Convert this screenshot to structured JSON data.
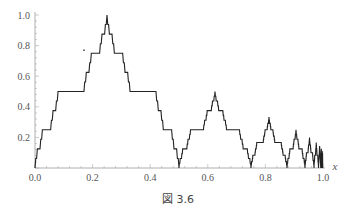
{
  "chart_data": {
    "type": "line",
    "title": "",
    "caption": "図 3.6",
    "xlabel": "x",
    "ylabel": "",
    "xlim": [
      0,
      1
    ],
    "ylim": [
      0,
      1.0
    ],
    "grid": false,
    "legend": null,
    "x_ticks": [
      0.0,
      0.2,
      0.4,
      0.6,
      0.8,
      1.0
    ],
    "x_tick_labels": [
      "0.0",
      "0.2",
      "0.4",
      "0.6",
      "0.8",
      "1.0"
    ],
    "y_ticks": [
      0.2,
      0.4,
      0.6,
      0.8,
      1.0
    ],
    "y_tick_labels": [
      "0.2",
      "0.4",
      "0.6",
      "0.8",
      "1.0"
    ],
    "segments": [
      {
        "x_start": 0.0,
        "x_end": 0.5,
        "peak_x": 0.25,
        "peak_y": 1.0
      },
      {
        "x_start": 0.5,
        "x_end": 0.75,
        "peak_x": 0.625,
        "peak_y": 0.5
      },
      {
        "x_start": 0.75,
        "x_end": 0.875,
        "peak_x": 0.8125,
        "peak_y": 0.333
      },
      {
        "x_start": 0.875,
        "x_end": 0.9375,
        "peak_x": 0.90625,
        "peak_y": 0.25
      },
      {
        "x_start": 0.9375,
        "x_end": 0.96875,
        "peak_x": 0.953,
        "peak_y": 0.2
      },
      {
        "x_start": 0.96875,
        "x_end": 0.984375,
        "peak_x": 0.977,
        "peak_y": 0.167
      }
    ],
    "staircase_ratio": 0.32,
    "annotations": [
      {
        "x": 0.17,
        "y": 0.77,
        "text": "·"
      }
    ]
  },
  "caption_text": "図 3.6"
}
